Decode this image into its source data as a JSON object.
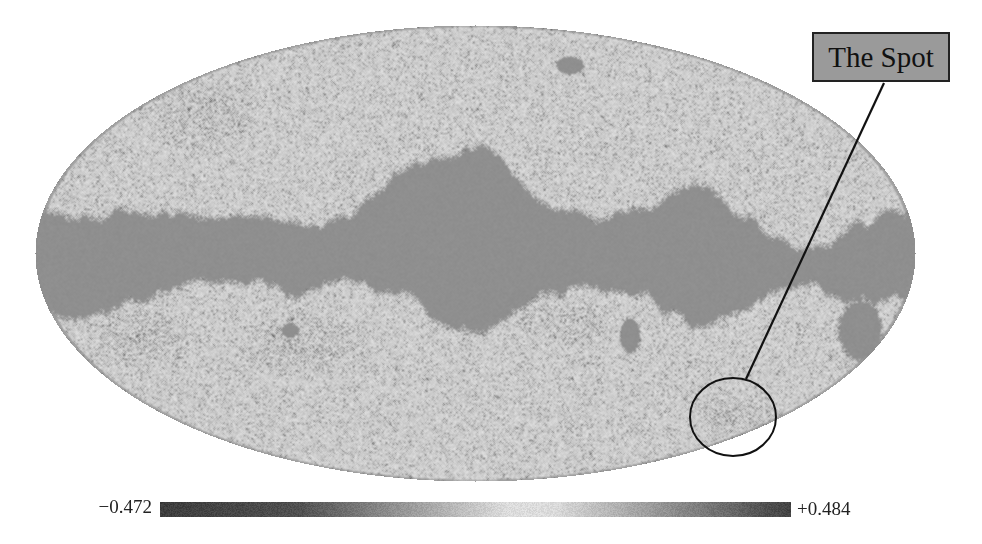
{
  "figure": {
    "map": {
      "projection": "mollweide",
      "center": [
        475,
        253
      ],
      "radii": [
        440,
        228
      ],
      "colors": {
        "background": "#ffffff",
        "mask": "#8f8f8f",
        "field_light": "#c8c8c8",
        "field_dark": "#3a3a3a"
      }
    },
    "annotation": {
      "label": "The Spot",
      "label_box": {
        "x": 812,
        "y": 32,
        "w": 138,
        "h": 50,
        "fill": "#9a9a9a"
      },
      "leader_line": {
        "x1": 884,
        "y1": 83,
        "x2": 746,
        "y2": 379
      },
      "circle": {
        "cx": 733,
        "cy": 417,
        "rx": 43,
        "ry": 39
      }
    },
    "colorbar": {
      "min_label": "−0.472",
      "max_label": "+0.484",
      "min_value": -0.472,
      "max_value": 0.484
    }
  }
}
